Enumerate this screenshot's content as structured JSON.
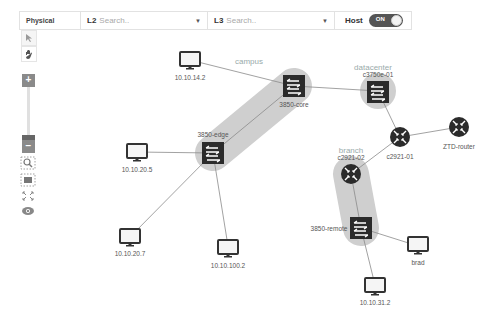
{
  "toolbar": {
    "layer": "Physical",
    "l2": {
      "level": "L2",
      "placeholder": "Search.."
    },
    "l3": {
      "level": "L3",
      "placeholder": "Search.."
    },
    "host": {
      "label": "Host",
      "toggle": "ON"
    }
  },
  "sidebar": {
    "tools": [
      "select-tool",
      "pan-tool"
    ],
    "zoom": {
      "plus": "+",
      "minus": "−"
    },
    "actions": [
      "zoom-selection",
      "fit-view",
      "fullscreen",
      "visibility"
    ]
  },
  "groups": {
    "campus": "campus",
    "datacenter": "datacenter",
    "branch": "branch"
  },
  "nodes": {
    "h1": "10.10.14.2",
    "core": "3850-core",
    "edge": "3850-edge",
    "h2": "10.10.20.5",
    "h3": "10.10.20.7",
    "h4": "10.10.100.2",
    "dc": "c3750e-01",
    "r1": "c2921-01",
    "ztd": "ZTD-router",
    "r2": "c2921-02",
    "remote": "3850-remote",
    "brad": "brad",
    "h5": "10.10.31.2"
  },
  "colors": {
    "device": "#2b2b2b",
    "group": "#c8c8c8",
    "link": "#888888",
    "toggle_bg": "#555555"
  }
}
